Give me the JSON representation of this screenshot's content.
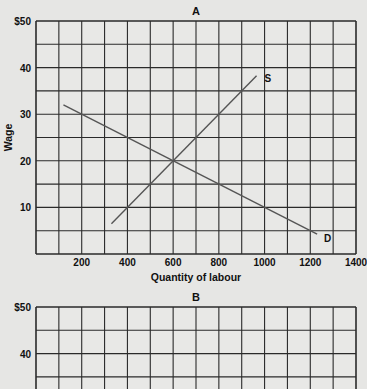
{
  "chart_data": [
    {
      "type": "line",
      "title": "A",
      "xlabel": "Quantity of labour",
      "ylabel": "Wage",
      "xlim": [
        0,
        1400
      ],
      "ylim": [
        0,
        50
      ],
      "grid": true,
      "x_ticks": [
        200,
        400,
        600,
        800,
        1000,
        1200,
        1400
      ],
      "x_tick_labels": [
        "200",
        "400",
        "600",
        "800",
        "1000",
        "1200",
        "1400"
      ],
      "y_ticks": [
        10,
        20,
        30,
        40,
        50
      ],
      "y_tick_labels": [
        "10",
        "20",
        "30",
        "40",
        "$50"
      ],
      "grid_x_step": 100,
      "grid_y_step": 5,
      "series": [
        {
          "name": "S",
          "label": "S",
          "x": [
            330,
            965
          ],
          "y": [
            6.5,
            38.25
          ],
          "color": "#555555"
        },
        {
          "name": "D",
          "label": "D",
          "x": [
            120,
            1230
          ],
          "y": [
            32,
            4.25
          ],
          "color": "#555555"
        }
      ],
      "annotations": [
        {
          "text": "S",
          "x": 1000,
          "y": 37
        },
        {
          "text": "D",
          "x": 1260,
          "y": 2.5
        }
      ],
      "equilibrium": {
        "x": 600,
        "y": 20
      }
    },
    {
      "type": "line",
      "title": "B",
      "xlabel": "",
      "ylabel": "",
      "xlim": [
        0,
        1400
      ],
      "ylim": [
        0,
        50
      ],
      "grid": true,
      "y_ticks": [
        40,
        50
      ],
      "y_tick_labels": [
        "40",
        "$50"
      ],
      "grid_x_step": 100,
      "grid_y_step": 5,
      "series": [],
      "note": "chart cropped at bottom of screenshot"
    }
  ]
}
